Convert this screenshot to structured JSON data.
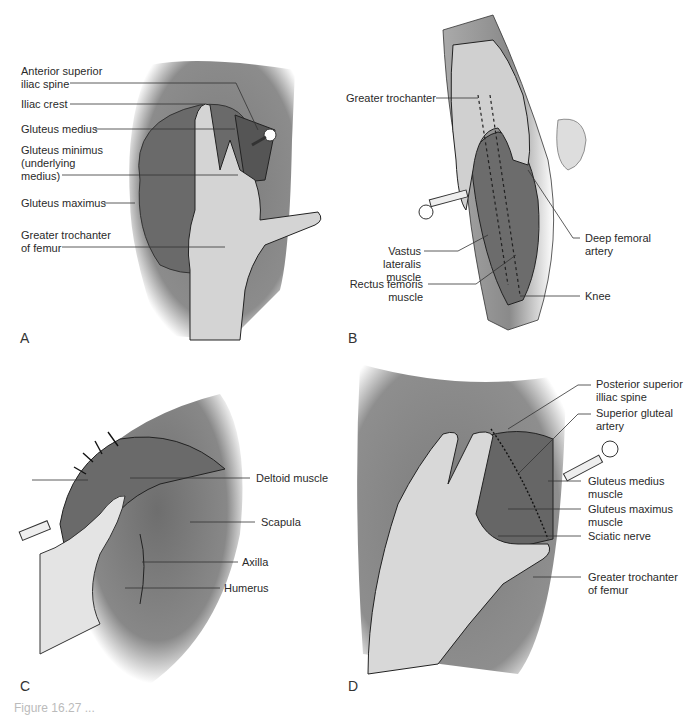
{
  "figure": {
    "panels": [
      {
        "letter": "A",
        "region": "ventrogluteal",
        "labels": [
          "Anterior superior\niliac spine",
          "Iliac crest",
          "Gluteus medius",
          "Gluteus minimus\n(underlying\nmedius)",
          "Gluteus maximus",
          "Greater trochanter\nof femur"
        ]
      },
      {
        "letter": "B",
        "region": "vastus-lateralis",
        "labels": [
          "Greater trochanter",
          "Vastus lateralis\nmuscle",
          "Rectus femoris\nmuscle",
          "Deep femoral\nartery",
          "Knee"
        ]
      },
      {
        "letter": "C",
        "region": "deltoid",
        "labels": [
          "Deltoid muscle",
          "Scapula",
          "Axilla",
          "Humerus"
        ]
      },
      {
        "letter": "D",
        "region": "dorsogluteal",
        "labels": [
          "Posterior superior\nilliac spine",
          "Superior gluteal\nartery",
          "Gluteus medius\nmuscle",
          "Gluteus maximus\nmuscle",
          "Sciatic nerve",
          "Greater trochanter\nof femur"
        ]
      }
    ],
    "caption_partial": "Figure 16.27 ..."
  },
  "colors": {
    "skin": "#9a9a9a",
    "muscle": "#6f6f6f",
    "glove": "#d9d9d9",
    "leader": "#333333"
  }
}
